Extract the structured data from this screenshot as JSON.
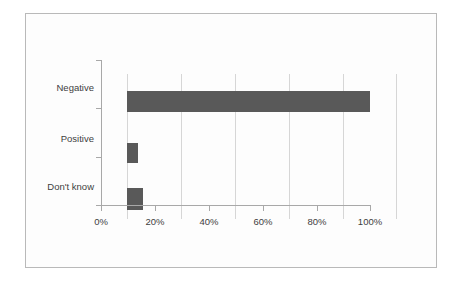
{
  "chart_data": {
    "type": "bar",
    "orientation": "horizontal",
    "title": "",
    "subtitle": "",
    "xlabel": "",
    "ylabel": "",
    "categories": [
      "Negative",
      "Positive",
      "Don't know"
    ],
    "values": [
      90,
      4,
      6
    ],
    "value_suffix": "%",
    "xlim": [
      0,
      100
    ],
    "xticks": [
      0,
      20,
      40,
      60,
      80,
      100
    ],
    "xtick_labels": [
      "0%",
      "20%",
      "40%",
      "60%",
      "80%",
      "100%"
    ],
    "grid": true,
    "grid_axis": "x",
    "legend": false,
    "legend_position": "none",
    "series": [
      {
        "name": "",
        "color": "#595959",
        "values": [
          90,
          4,
          6
        ]
      }
    ],
    "colors": {
      "bar": "#595959",
      "gridline": "#d6d6d6",
      "axis": "#a8a8a8",
      "frame_border": "#b9b9b9",
      "plot_background": "#fdfdfd",
      "text": "#3e3e3e"
    }
  }
}
